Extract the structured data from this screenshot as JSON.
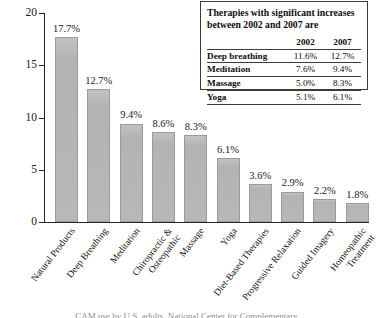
{
  "chart_data": {
    "type": "bar",
    "title": "",
    "xlabel": "",
    "ylabel": "",
    "ylim": [
      0,
      20
    ],
    "yticks": [
      0,
      5,
      10,
      15,
      20
    ],
    "grid": false,
    "legend_position": "top-right",
    "categories": [
      "Natural Products",
      "Deep Breathing",
      "Meditation",
      "Chiropractic & Osteopathic",
      "Massage",
      "Yoga",
      "Diet-Based Therapies",
      "Progressive Relaxation",
      "Guided Imagery",
      "Homeopathic Treatment"
    ],
    "values": [
      17.7,
      12.7,
      9.4,
      8.6,
      8.3,
      6.1,
      3.6,
      2.9,
      2.2,
      1.8
    ],
    "value_labels": [
      "17.7%",
      "12.7%",
      "9.4%",
      "8.6%",
      "8.3%",
      "6.1%",
      "3.6%",
      "2.9%",
      "2.2%",
      "1.8%"
    ],
    "bar_color": "#b6b6b6",
    "bar_edge_color": "#9a9a9a",
    "axis_color": "#272727"
  },
  "categories_display": [
    {
      "line1": "Natural Products",
      "line2": ""
    },
    {
      "line1": "Deep Breathing",
      "line2": ""
    },
    {
      "line1": "Meditation",
      "line2": ""
    },
    {
      "line1": "Chiropractic &",
      "line2": "Osteopathic"
    },
    {
      "line1": "Massage",
      "line2": ""
    },
    {
      "line1": "Yoga",
      "line2": ""
    },
    {
      "line1": "Diet-Based Therapies",
      "line2": ""
    },
    {
      "line1": "Progressive Relaxation",
      "line2": ""
    },
    {
      "line1": "Guided Imagery",
      "line2": ""
    },
    {
      "line1": "Homeopathic",
      "line2": "Treatment"
    }
  ],
  "y_axis": {
    "ticks": [
      "20",
      "15",
      "10",
      "5",
      "0"
    ]
  },
  "info_box": {
    "title": "Therapies with significant increases between 2002 and 2007 are",
    "columns": [
      "",
      "2002",
      "2007"
    ],
    "rows": [
      {
        "therapy": "Deep breathing",
        "y2002": "11.6%",
        "y2007": "12.7%"
      },
      {
        "therapy": "Meditation",
        "y2002": "7.6%",
        "y2007": "9.4%"
      },
      {
        "therapy": "Massage",
        "y2002": "5.0%",
        "y2007": "8.3%"
      },
      {
        "therapy": "Yoga",
        "y2002": "5.1%",
        "y2007": "6.1%"
      }
    ]
  },
  "source_caption": "CAM use by U.S. adults, National Center for Complementary"
}
